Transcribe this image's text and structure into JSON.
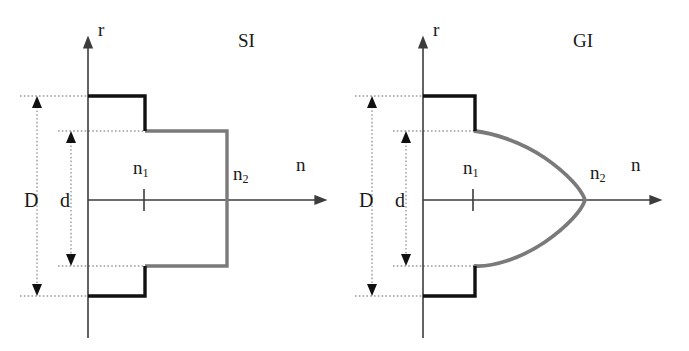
{
  "figure": {
    "background_color": "#ffffff",
    "core_line_color": "#111111",
    "cladding_line_color": "#7a7a7a",
    "axis_line_color": "#3c3c3c",
    "dotted_guide_color": "#9a9a9a",
    "panels": [
      {
        "id": "si",
        "title": "SI",
        "title_x": 238,
        "title_y": 31,
        "axis": {
          "origin_x": 88,
          "origin_y": 200,
          "vertical_label": "r",
          "vertical_label_x": 98,
          "vertical_label_y": 20,
          "vertical_top_y": 47,
          "vertical_bottom_y": 338,
          "horizontal_label": "n",
          "horizontal_label_x": 296,
          "horizontal_label_y": 155,
          "horizontal_end_x": 320
        },
        "dimensions": [
          {
            "name": "D",
            "label": "D",
            "label_x": 24,
            "label_y": 190,
            "arrow_x": 37,
            "top_y": 96,
            "bottom_y": 296,
            "guide_from_x": 20,
            "guide_to_x": 145
          },
          {
            "name": "d",
            "label": "d",
            "label_x": 60,
            "label_y": 190,
            "arrow_x": 71,
            "top_y": 131,
            "bottom_y": 266,
            "guide_from_x": 58,
            "guide_to_x": 227
          }
        ],
        "index_labels": [
          {
            "name": "n1",
            "base": "n",
            "sub": "1",
            "x": 133,
            "y": 158
          },
          {
            "name": "n2",
            "base": "n",
            "sub": "2",
            "x": 233,
            "y": 164
          }
        ],
        "tick": {
          "x": 144,
          "half_height": 11
        },
        "profile_type": "step-index",
        "core_step_x": 145,
        "cladding_wall_x": 227,
        "core_top_y": 96,
        "core_bottom_y": 296,
        "clad_top_y": 131,
        "clad_bottom_y": 266
      },
      {
        "id": "gi",
        "title": "GI",
        "title_x": 573,
        "title_y": 31,
        "axis": {
          "origin_x": 423,
          "origin_y": 200,
          "vertical_label": "r",
          "vertical_label_x": 433,
          "vertical_label_y": 20,
          "vertical_top_y": 47,
          "vertical_bottom_y": 338,
          "horizontal_label": "n",
          "horizontal_label_x": 631,
          "horizontal_label_y": 155,
          "horizontal_end_x": 655
        },
        "dimensions": [
          {
            "name": "D",
            "label": "D",
            "label_x": 359,
            "label_y": 190,
            "arrow_x": 372,
            "top_y": 96,
            "bottom_y": 296,
            "guide_from_x": 355,
            "guide_to_x": 475
          },
          {
            "name": "d",
            "label": "d",
            "label_x": 395,
            "label_y": 190,
            "arrow_x": 406,
            "top_y": 131,
            "bottom_y": 266,
            "guide_from_x": 393,
            "guide_to_x": 475
          }
        ],
        "index_labels": [
          {
            "name": "n1",
            "base": "n",
            "sub": "1",
            "x": 463,
            "y": 158
          },
          {
            "name": "n2",
            "base": "n",
            "sub": "2",
            "x": 590,
            "y": 163
          }
        ],
        "tick": {
          "x": 473,
          "half_height": 11
        },
        "profile_type": "graded-index",
        "core_step_x": 475,
        "parabola_apex_x": 585,
        "core_top_y": 96,
        "core_bottom_y": 296,
        "clad_top_y": 131,
        "clad_bottom_y": 266
      }
    ]
  }
}
